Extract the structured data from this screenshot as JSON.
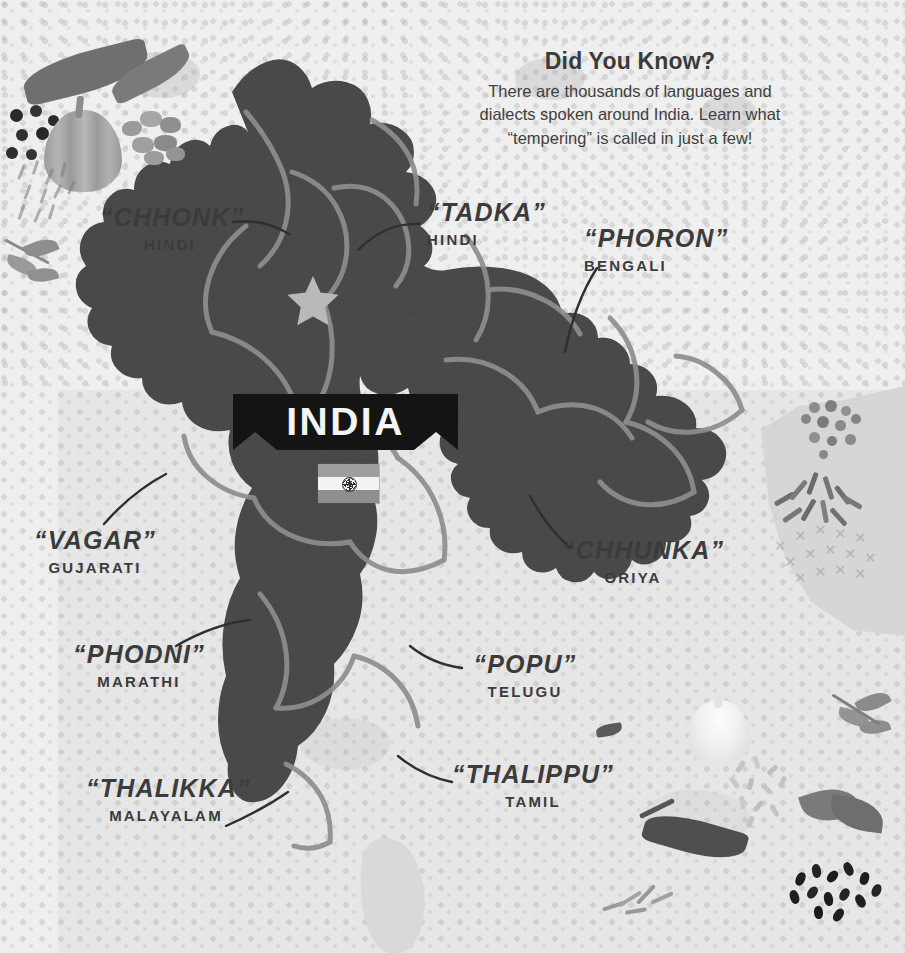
{
  "poster": {
    "title_text": "INDIA",
    "country_label_name": "india-banner",
    "flag_name": "india-flag"
  },
  "headline": {
    "title": "Did You Know?",
    "line1": "There are thousands of languages and",
    "line2": "dialects spoken around India. Learn what",
    "line3": "“tempering” is called in just a few!"
  },
  "callouts": [
    {
      "term": "“CHHONK”",
      "language": "HINDI",
      "name": "callout-chhonk"
    },
    {
      "term": "“TADKA”",
      "language": "HINDI",
      "name": "callout-tadka"
    },
    {
      "term": "“PHORON”",
      "language": "BENGALI",
      "name": "callout-phoron"
    },
    {
      "term": "“VAGAR”",
      "language": "GUJARATI",
      "name": "callout-vagar"
    },
    {
      "term": "“CHHUNKA”",
      "language": "ORIYA",
      "name": "callout-chhunka"
    },
    {
      "term": "“PHODNI”",
      "language": "MARATHI",
      "name": "callout-phodni"
    },
    {
      "term": "“POPU”",
      "language": "TELUGU",
      "name": "callout-popu"
    },
    {
      "term": "“THALIKKA”",
      "language": "MALAYALAM",
      "name": "callout-thalikka"
    },
    {
      "term": "“THALIPPU”",
      "language": "TAMIL",
      "name": "callout-thalippu"
    }
  ],
  "map": {
    "capital_marker": "star",
    "neighbor_landmass": "sri-lanka"
  },
  "colors": {
    "background": "#e6e6e6",
    "background_light": "#efefef",
    "land_fill": "#4a4a4a",
    "state_border": "#8e8e8e",
    "neighbor_fill": "#d6d6d6",
    "banner_fill": "#141414",
    "banner_text": "#f4f4f4",
    "text": "#3b3b3b",
    "flag_saffron": "#9e9e9e",
    "flag_white": "#f3f3f3",
    "flag_green": "#8e8e8e",
    "chakra": "#2e2e2e",
    "star_marker": "#b9b9b9"
  },
  "decorations": [
    {
      "name": "chili-peppers-top-left"
    },
    {
      "name": "black-peppercorns"
    },
    {
      "name": "onion-bulb"
    },
    {
      "name": "cardamom-pods"
    },
    {
      "name": "cumin-seeds-left"
    },
    {
      "name": "olive-leaf-sprig-left"
    },
    {
      "name": "mustard-seeds-right"
    },
    {
      "name": "cumin-seeds-right"
    },
    {
      "name": "crosshatch-pattern-right"
    },
    {
      "name": "garlic-bulb"
    },
    {
      "name": "herb-sprig-bottom-right"
    },
    {
      "name": "bay-leaves"
    },
    {
      "name": "chili-pepper-bottom"
    },
    {
      "name": "nigella-seeds"
    },
    {
      "name": "rice-grains"
    },
    {
      "name": "coriander-sprig-bottom"
    }
  ]
}
